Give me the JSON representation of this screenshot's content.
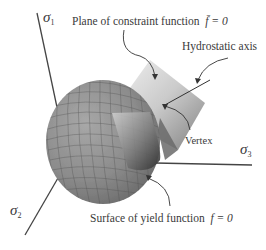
{
  "diagram": {
    "labels": {
      "plane": "Plane of constraint function",
      "plane_eq": "f̄ = 0",
      "hydrostatic": "Hydrostatic axis",
      "vertex": "Vertex",
      "surface": "Surface of yield function",
      "surface_eq": "f = 0"
    },
    "axes": [
      {
        "symbol": "σ",
        "sub": "1"
      },
      {
        "symbol": "σ",
        "sub": "2"
      },
      {
        "symbol": "σ",
        "sub": "3"
      }
    ],
    "colors": {
      "ellipsoid": "#8a8a8a",
      "mesh": "#555555",
      "plane_light": "#e8e8e8",
      "plane_dark": "#777777",
      "axis": "#444444",
      "text": "#3a3a3a"
    }
  }
}
